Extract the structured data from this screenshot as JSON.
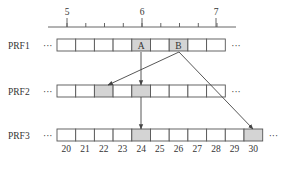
{
  "axis": {
    "major_ticks": [
      {
        "label": "5",
        "x": 67
      },
      {
        "label": "6",
        "x": 142
      },
      {
        "label": "7",
        "x": 216
      }
    ],
    "x_start": 48,
    "x_end": 236,
    "y": 27,
    "minor_step": 18.75
  },
  "rows": [
    {
      "name": "PRF1",
      "y": 39,
      "cell_count": 9,
      "cells": [
        {
          "label": "",
          "shaded": false
        },
        {
          "label": "",
          "shaded": false
        },
        {
          "label": "",
          "shaded": false
        },
        {
          "label": "",
          "shaded": false
        },
        {
          "label": "A",
          "shaded": true
        },
        {
          "label": "",
          "shaded": false
        },
        {
          "label": "B",
          "shaded": true
        },
        {
          "label": "",
          "shaded": false
        },
        {
          "label": "",
          "shaded": false
        }
      ],
      "left_ellipsis": "···",
      "right_ellipsis": "···"
    },
    {
      "name": "PRF2",
      "y": 85,
      "cell_count": 9,
      "cells": [
        {
          "label": "",
          "shaded": false
        },
        {
          "label": "",
          "shaded": false
        },
        {
          "label": "",
          "shaded": true
        },
        {
          "label": "",
          "shaded": false
        },
        {
          "label": "",
          "shaded": true
        },
        {
          "label": "",
          "shaded": false
        },
        {
          "label": "",
          "shaded": false
        },
        {
          "label": "",
          "shaded": false
        },
        {
          "label": "",
          "shaded": false
        }
      ],
      "left_ellipsis": "···",
      "right_ellipsis": "···"
    },
    {
      "name": "PRF3",
      "y": 129,
      "cell_count": 11,
      "cells": [
        {
          "label": "",
          "shaded": false,
          "index": "20"
        },
        {
          "label": "",
          "shaded": false,
          "index": "21"
        },
        {
          "label": "",
          "shaded": false,
          "index": "22"
        },
        {
          "label": "",
          "shaded": false,
          "index": "23"
        },
        {
          "label": "",
          "shaded": true,
          "index": "24"
        },
        {
          "label": "",
          "shaded": false,
          "index": "25"
        },
        {
          "label": "",
          "shaded": false,
          "index": "26"
        },
        {
          "label": "",
          "shaded": false,
          "index": "27"
        },
        {
          "label": "",
          "shaded": false,
          "index": "28"
        },
        {
          "label": "",
          "shaded": false,
          "index": "29"
        },
        {
          "label": "",
          "shaded": true,
          "index": "30"
        }
      ],
      "left_ellipsis": "···",
      "right_ellipsis": "···"
    }
  ],
  "arrows": [
    {
      "from": "PRF1.A",
      "to": "PRF2.cell5",
      "x1": 141,
      "y1": 52,
      "x2": 141,
      "y2": 85
    },
    {
      "from": "PRF1.B",
      "to": "PRF2.cell3",
      "x1": 179,
      "y1": 52,
      "x2": 108,
      "y2": 85
    },
    {
      "from": "PRF1.B",
      "to": "PRF3.30",
      "x1": 179,
      "y1": 52,
      "x2": 253,
      "y2": 129
    },
    {
      "from": "PRF2.cell5",
      "to": "PRF3.24",
      "x1": 141,
      "y1": 97,
      "x2": 141,
      "y2": 129
    }
  ],
  "layout": {
    "cell_x0": 57,
    "cell_w": 18.7,
    "cell_h": 12
  }
}
